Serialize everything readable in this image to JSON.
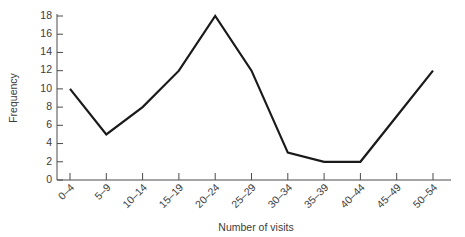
{
  "chart_data": {
    "type": "line",
    "title": "",
    "subtitle": "",
    "xlabel": "Number of visits",
    "ylabel": "Frequency",
    "categories": [
      "0–4",
      "5–9",
      "10–14",
      "15–19",
      "20–24",
      "25–29",
      "30–34",
      "35–39",
      "40–44",
      "45–49",
      "50–54"
    ],
    "values": [
      10,
      5,
      8,
      12,
      18,
      12,
      3,
      2,
      2,
      7,
      12
    ],
    "series": [
      {
        "name": "Frequency",
        "values": [
          10,
          5,
          8,
          12,
          18,
          12,
          3,
          2,
          2,
          7,
          12
        ]
      }
    ],
    "ylim": [
      0,
      18
    ],
    "ytick_labels": [
      "0",
      "2",
      "4",
      "6",
      "8",
      "10",
      "12",
      "14",
      "16",
      "18"
    ],
    "ytick_values": [
      0,
      2,
      4,
      6,
      8,
      10,
      12,
      14,
      16,
      18
    ],
    "xlim": [
      0,
      10
    ],
    "grid": false,
    "legend": false,
    "legend_position": "none",
    "line_color": "#1a1a1a",
    "axis_color": "#4a4a4a",
    "background_color": "#ffffff",
    "xtick_label_rotation": 45,
    "annotations": []
  }
}
